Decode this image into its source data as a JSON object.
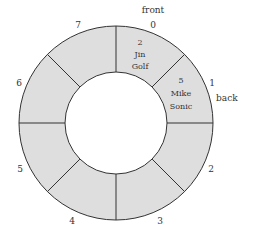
{
  "diagram": {
    "slot_count": 8,
    "fill_color": "#dedede",
    "stroke_color": "#333333",
    "slots": [
      {
        "index": "0",
        "lines": [
          "2",
          "Jin",
          "Golf"
        ]
      },
      {
        "index": "1",
        "lines": [
          "5",
          "Mike",
          "Sonic"
        ]
      },
      {
        "index": "2",
        "lines": []
      },
      {
        "index": "3",
        "lines": []
      },
      {
        "index": "4",
        "lines": []
      },
      {
        "index": "5",
        "lines": []
      },
      {
        "index": "6",
        "lines": []
      },
      {
        "index": "7",
        "lines": []
      }
    ],
    "pointers": {
      "front": "front",
      "back": "back"
    }
  }
}
